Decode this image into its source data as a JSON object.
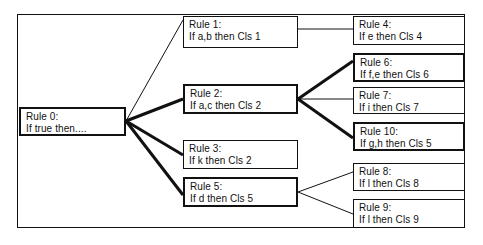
{
  "diagram": {
    "stroke_color": "#111111",
    "background_color": "#ffffff",
    "frame": {
      "x": 17,
      "y": 14,
      "width": 448,
      "height": 214
    },
    "nodes": [
      {
        "id": "rule-0",
        "title": "Rule 0:",
        "body": "If true then....",
        "x": 19,
        "y": 107,
        "width": 107,
        "height": 29,
        "emphasis": "thick"
      },
      {
        "id": "rule-1",
        "title": "Rule 1:",
        "body": "If a,b then Cls 1",
        "x": 183,
        "y": 16,
        "width": 115,
        "height": 32,
        "emphasis": "thin"
      },
      {
        "id": "rule-2",
        "title": "Rule 2:",
        "body": "If a,c then Cls 2",
        "x": 183,
        "y": 84,
        "width": 115,
        "height": 30,
        "emphasis": "thick"
      },
      {
        "id": "rule-3",
        "title": "Rule 3:",
        "body": "If k then Cls 2",
        "x": 183,
        "y": 140,
        "width": 115,
        "height": 29,
        "emphasis": "thin"
      },
      {
        "id": "rule-5",
        "title": "Rule 5:",
        "body": "If d then Cls 5",
        "x": 183,
        "y": 177,
        "width": 115,
        "height": 30,
        "emphasis": "thick"
      },
      {
        "id": "rule-4",
        "title": "Rule 4:",
        "body": "If e then Cls 4",
        "x": 353,
        "y": 16,
        "width": 112,
        "height": 29,
        "emphasis": "thin"
      },
      {
        "id": "rule-6",
        "title": "Rule 6:",
        "body": "If f,e then Cls 6",
        "x": 353,
        "y": 53,
        "width": 112,
        "height": 29,
        "emphasis": "thick"
      },
      {
        "id": "rule-7",
        "title": "Rule 7:",
        "body": "If i then Cls 7",
        "x": 353,
        "y": 87,
        "width": 112,
        "height": 27,
        "emphasis": "thin"
      },
      {
        "id": "rule-10",
        "title": "Rule 10:",
        "body": "If g,h then Cls 5",
        "x": 353,
        "y": 122,
        "width": 112,
        "height": 29,
        "emphasis": "thick"
      },
      {
        "id": "rule-8",
        "title": "Rule 8:",
        "body": "If l then Cls 8",
        "x": 353,
        "y": 163,
        "width": 112,
        "height": 28,
        "emphasis": "thin"
      },
      {
        "id": "rule-9",
        "title": "Rule 9:",
        "body": "If l then Cls 9",
        "x": 353,
        "y": 199,
        "width": 112,
        "height": 29,
        "emphasis": "thin"
      }
    ],
    "edges": [
      {
        "id": "edge-rule0-rule1",
        "from": "rule-0",
        "to": "rule-1",
        "weight": "thin",
        "x1": 126,
        "y1": 121,
        "x2": 183,
        "y2": 20
      },
      {
        "id": "edge-rule0-rule2",
        "from": "rule-0",
        "to": "rule-2",
        "weight": "thick",
        "x1": 126,
        "y1": 121,
        "x2": 183,
        "y2": 99
      },
      {
        "id": "edge-rule0-rule3",
        "from": "rule-0",
        "to": "rule-3",
        "weight": "thick",
        "x1": 126,
        "y1": 121,
        "x2": 183,
        "y2": 155
      },
      {
        "id": "edge-rule0-rule5",
        "from": "rule-0",
        "to": "rule-5",
        "weight": "thick",
        "x1": 126,
        "y1": 121,
        "x2": 183,
        "y2": 195
      },
      {
        "id": "edge-rule1-rule4",
        "from": "rule-1",
        "to": "rule-4",
        "weight": "thin",
        "x1": 298,
        "y1": 29,
        "x2": 353,
        "y2": 29
      },
      {
        "id": "edge-rule2-rule6",
        "from": "rule-2",
        "to": "rule-6",
        "weight": "thick",
        "x1": 298,
        "y1": 99,
        "x2": 353,
        "y2": 61
      },
      {
        "id": "edge-rule2-rule7",
        "from": "rule-2",
        "to": "rule-7",
        "weight": "thin",
        "x1": 298,
        "y1": 99,
        "x2": 353,
        "y2": 99
      },
      {
        "id": "edge-rule2-rule10",
        "from": "rule-2",
        "to": "rule-10",
        "weight": "thick",
        "x1": 298,
        "y1": 99,
        "x2": 353,
        "y2": 138
      },
      {
        "id": "edge-rule5-rule8",
        "from": "rule-5",
        "to": "rule-8",
        "weight": "thin",
        "x1": 298,
        "y1": 192,
        "x2": 353,
        "y2": 172
      },
      {
        "id": "edge-rule5-rule9",
        "from": "rule-5",
        "to": "rule-9",
        "weight": "thin",
        "x1": 298,
        "y1": 192,
        "x2": 353,
        "y2": 214
      }
    ]
  }
}
